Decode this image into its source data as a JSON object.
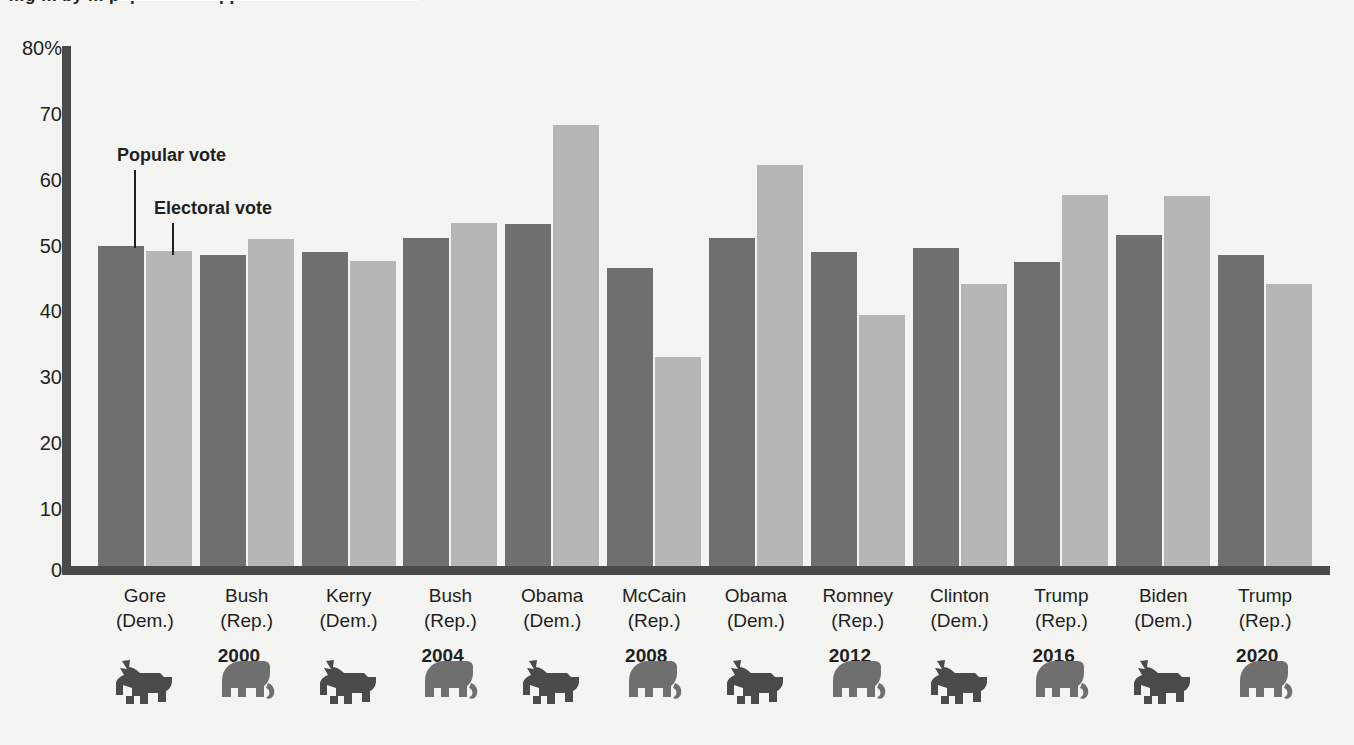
{
  "caption": {
    "clipped_text": "…g … by … popular … support …",
    "note": "top caption line is cut off at the top edge of the screenshot"
  },
  "legend": {
    "popular_label": "Popular vote",
    "electoral_label": "Electoral vote",
    "popular_color": "#6f6f6f",
    "electoral_color": "#b6b6b6"
  },
  "axis": {
    "y_ticks": [
      "80%",
      "70",
      "60",
      "50",
      "40",
      "30",
      "20",
      "10",
      "0"
    ],
    "y_values": [
      80,
      70,
      60,
      50,
      40,
      30,
      20,
      10,
      0
    ],
    "axis_color": "#4a4a4a"
  },
  "years": [
    "2000",
    "2004",
    "2008",
    "2012",
    "2016",
    "2020"
  ],
  "candidates": [
    {
      "name": "Gore",
      "party": "(Dem.)",
      "icon": "donkey-icon",
      "year": "2000"
    },
    {
      "name": "Bush",
      "party": "(Rep.)",
      "icon": "elephant-icon",
      "year": "2000"
    },
    {
      "name": "Kerry",
      "party": "(Dem.)",
      "icon": "donkey-icon",
      "year": "2004"
    },
    {
      "name": "Bush",
      "party": "(Rep.)",
      "icon": "elephant-icon",
      "year": "2004"
    },
    {
      "name": "Obama",
      "party": "(Dem.)",
      "icon": "donkey-icon",
      "year": "2008"
    },
    {
      "name": "McCain",
      "party": "(Rep.)",
      "icon": "elephant-icon",
      "year": "2008"
    },
    {
      "name": "Obama",
      "party": "(Dem.)",
      "icon": "donkey-icon",
      "year": "2012"
    },
    {
      "name": "Romney",
      "party": "(Rep.)",
      "icon": "elephant-icon",
      "year": "2012"
    },
    {
      "name": "Clinton",
      "party": "(Dem.)",
      "icon": "donkey-icon",
      "year": "2016"
    },
    {
      "name": "Trump",
      "party": "(Rep.)",
      "icon": "elephant-icon",
      "year": "2016"
    },
    {
      "name": "Biden",
      "party": "(Dem.)",
      "icon": "donkey-icon",
      "year": "2020"
    },
    {
      "name": "Trump",
      "party": "(Rep.)",
      "icon": "elephant-icon",
      "year": "2020"
    }
  ],
  "chart_data": {
    "type": "bar",
    "title": "",
    "xlabel": "",
    "ylabel": "",
    "ylim": [
      0,
      80
    ],
    "yticks": [
      0,
      10,
      20,
      30,
      40,
      50,
      60,
      70,
      80
    ],
    "grid": false,
    "legend_position": "inline-callout",
    "categories": [
      "Gore (Dem.) 2000",
      "Bush (Rep.) 2000",
      "Kerry (Dem.) 2004",
      "Bush (Rep.) 2004",
      "Obama (Dem.) 2008",
      "McCain (Rep.) 2008",
      "Obama (Dem.) 2012",
      "Romney (Rep.) 2012",
      "Clinton (Dem.) 2016",
      "Trump (Rep.) 2016",
      "Biden (Dem.) 2020",
      "Trump (Rep.) 2020"
    ],
    "series": [
      {
        "name": "Popular vote",
        "color": "#6f6f6f",
        "values": [
          49.3,
          47.9,
          48.3,
          50.5,
          52.6,
          45.8,
          50.4,
          48.3,
          48.9,
          46.8,
          51.0,
          47.8
        ]
      },
      {
        "name": "Electoral vote",
        "color": "#b6b6b6",
        "values": [
          48.4,
          50.3,
          46.9,
          52.7,
          67.8,
          32.2,
          61.7,
          38.6,
          43.4,
          57.1,
          56.9,
          43.4
        ]
      }
    ]
  }
}
